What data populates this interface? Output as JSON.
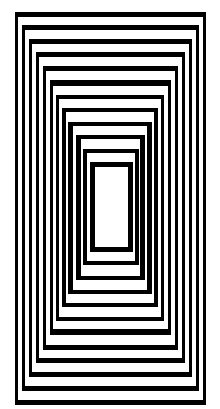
{
  "artwork": {
    "title": "Nested rectangles op-art",
    "stroke_color": "#000000",
    "background_color": "#ffffff",
    "frame_count": 12
  }
}
